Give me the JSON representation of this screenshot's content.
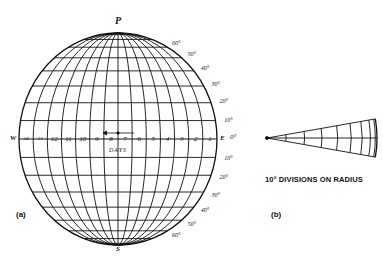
{
  "figure_a": {
    "panel_label": "(a)",
    "north_pole_label": "P",
    "south_pole_label": "S",
    "west_label": "W",
    "east_label": "E",
    "axis_label": "DAYS",
    "day_labels": [
      "14",
      "13",
      "12",
      "11",
      "10",
      "9",
      "8",
      "7",
      "6",
      "5",
      "4",
      "3",
      "2",
      "1"
    ],
    "latitude_labels_north": [
      "60°",
      "50°",
      "40°",
      "30°",
      "20°",
      "10°"
    ],
    "equator_label": "0°",
    "latitude_labels_south": [
      "10°",
      "20°",
      "30°",
      "40°",
      "50°",
      "60°"
    ]
  },
  "figure_b": {
    "panel_label": "(b)",
    "caption": "10° DIVISIONS ON RADIUS"
  }
}
